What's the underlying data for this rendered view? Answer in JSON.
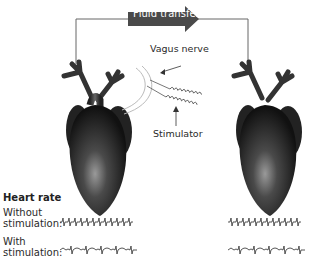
{
  "diagram": {
    "arrow_label": "Fluid transfer",
    "labels": {
      "vagus_nerve": "Vagus nerve",
      "stimulator": "Stimulator"
    },
    "heart_rate": {
      "title": "Heart rate",
      "rows": [
        {
          "label_line1": "Without",
          "label_line2": "stimulation:",
          "trace": "regular-fast"
        },
        {
          "label_line1": "With",
          "label_line2": "stimulation:",
          "trace": "slowed-wavy"
        }
      ]
    },
    "hearts": [
      {
        "name": "donor-heart",
        "position": "left",
        "stimulated": true
      },
      {
        "name": "recipient-heart",
        "position": "right",
        "stimulated": false
      }
    ],
    "colors": {
      "arrow": "#4a4a4a",
      "heart": "#2b2b2b",
      "lines": "#555555",
      "text": "#2a2a2a"
    }
  }
}
